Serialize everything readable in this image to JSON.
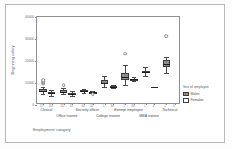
{
  "chart_data": {
    "type": "box",
    "title": "",
    "xlabel": "Employment category",
    "ylabel": "Beginning salary",
    "ylim": [
      0,
      40000
    ],
    "yticks": [
      0,
      10000,
      20000,
      30000,
      40000
    ],
    "ytick_labels": [
      "0",
      "10000",
      "20000",
      "30000",
      "40000"
    ],
    "grid": false,
    "legend": {
      "title": "Sex of employee",
      "position": "right",
      "entries": [
        {
          "name": "Males",
          "color": "#8c8c8c"
        },
        {
          "name": "Females",
          "color": "#fbfbfb"
        }
      ]
    },
    "categories": [
      "Clerical",
      "Office trainee",
      "Security officer",
      "College trainee",
      "Exempt employee",
      "MBA trainee",
      "Technical"
    ],
    "counts": [
      "227",
      "110",
      "111",
      "41",
      "60",
      "32",
      "1",
      "84",
      "1",
      "80",
      "1",
      "4",
      "1",
      "6"
    ],
    "series": [
      {
        "name": "Males",
        "boxes": [
          {
            "category": "Clerical",
            "min": 4800,
            "q1": 5700,
            "median": 6300,
            "q3": 7200,
            "max": 8400,
            "outliers": [
              9600,
              10200,
              10800,
              11400
            ]
          },
          {
            "category": "Office trainee",
            "min": 4800,
            "q1": 5400,
            "median": 6000,
            "q3": 6600,
            "max": 7800,
            "outliers": [
              9000
            ]
          },
          {
            "category": "Security officer",
            "min": 5400,
            "q1": 6000,
            "median": 6300,
            "q3": 6600,
            "max": 7200,
            "outliers": []
          },
          {
            "category": "College trainee",
            "min": 8400,
            "q1": 9600,
            "median": 10200,
            "q3": 11400,
            "max": 13200,
            "outliers": []
          },
          {
            "category": "Exempt employee",
            "min": 9000,
            "q1": 11400,
            "median": 12600,
            "q3": 14400,
            "max": 18000,
            "outliers": [
              23400
            ]
          },
          {
            "category": "MBA trainee",
            "min": 13200,
            "q1": 14400,
            "median": 15000,
            "q3": 15600,
            "max": 17400,
            "outliers": []
          },
          {
            "category": "Technical",
            "min": 14400,
            "q1": 17400,
            "median": 18600,
            "q3": 20400,
            "max": 21600,
            "outliers": [
              31200
            ]
          }
        ]
      },
      {
        "name": "Females",
        "boxes": [
          {
            "category": "Clerical",
            "min": 4200,
            "q1": 5100,
            "median": 5400,
            "q3": 6000,
            "max": 6900,
            "outliers": []
          },
          {
            "category": "Office trainee",
            "min": 4200,
            "q1": 4800,
            "median": 5100,
            "q3": 5400,
            "max": 6300,
            "outliers": []
          },
          {
            "category": "Security officer",
            "min": 5400,
            "q1": 5700,
            "median": 6000,
            "q3": 6000,
            "max": 6300,
            "outliers": [
              4800
            ]
          },
          {
            "category": "College trainee",
            "min": 7800,
            "q1": 8100,
            "median": 8400,
            "q3": 8700,
            "max": 9000,
            "outliers": []
          },
          {
            "category": "Exempt employee",
            "min": 10800,
            "q1": 11400,
            "median": 11700,
            "q3": 12000,
            "max": 12600,
            "outliers": []
          },
          {
            "category": "MBA trainee",
            "min": 0,
            "q1": 0,
            "median": 8400,
            "q3": 0,
            "max": 0,
            "outliers": []
          },
          {
            "category": "Technical",
            "min": 0,
            "q1": 0,
            "median": 0,
            "q3": 0,
            "max": 0,
            "outliers": []
          }
        ]
      }
    ]
  }
}
